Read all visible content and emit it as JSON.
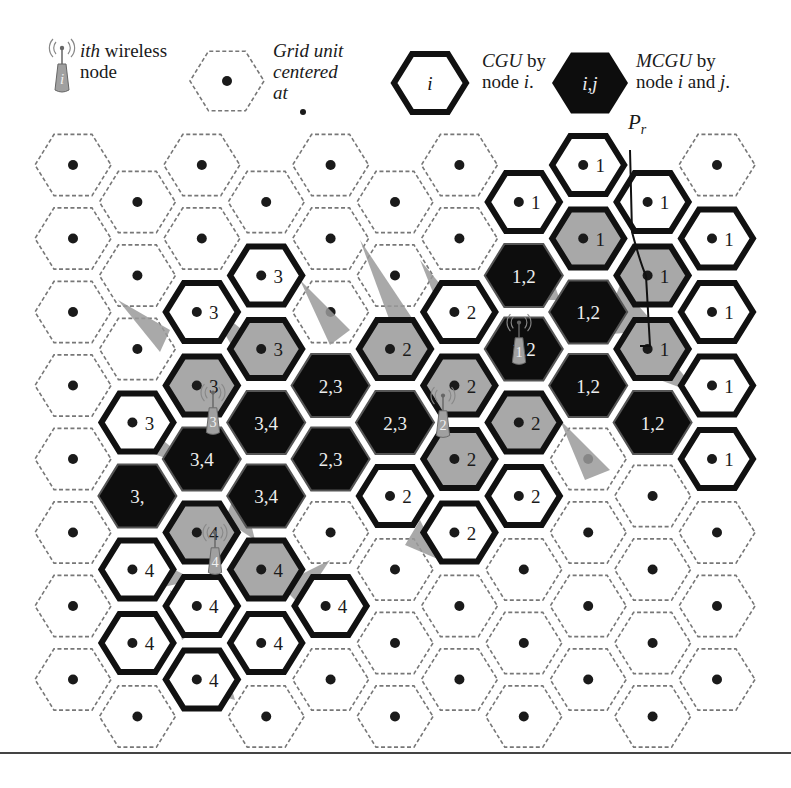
{
  "legend": {
    "node": {
      "italic": "ith",
      "text1": " wireless",
      "text2": "node",
      "glyph": "i"
    },
    "grid_unit": {
      "line1": "Grid unit",
      "line2": "centered",
      "line3": "at"
    },
    "cgu": {
      "glyph": "i",
      "italic": "CGU",
      "text1": " by",
      "text2": "node ",
      "text2_italic": "i",
      "text2_end": "."
    },
    "mcgu": {
      "glyph": "i,j",
      "italic": "MCGU",
      "text1": " by",
      "text2": "node ",
      "i": "i",
      "and": " and ",
      "j": "j",
      "end": "."
    }
  },
  "pr_label": {
    "main": "P",
    "sub": "r"
  },
  "colors": {
    "cgu_border": "#111111",
    "mcgu_fill": "#0d0d0d",
    "shadow_gray": "#9a9a9a",
    "covered_gray": "#a8a8a8",
    "dashed": "#777777",
    "dot": "#1a1a1a",
    "node_body": "#a0a0a0"
  },
  "grid": {
    "columns": 11,
    "rows": 8,
    "x0": 73,
    "col_step": 64.4,
    "y0_even": 165,
    "y0_odd": 202,
    "row_step": 73.5,
    "hex_radius": 40,
    "cells": [
      {
        "c": 1,
        "r": 3,
        "type": "cgu",
        "label": "3",
        "fill": "white"
      },
      {
        "c": 1,
        "r": 4,
        "type": "mcgu",
        "label": "3,"
      },
      {
        "c": 1,
        "r": 5,
        "type": "cgu",
        "label": "4",
        "fill": "white"
      },
      {
        "c": 1,
        "r": 6,
        "type": "cgu",
        "label": "4",
        "fill": "white"
      },
      {
        "c": 2,
        "r": 2,
        "type": "cgu",
        "label": "3",
        "fill": "white"
      },
      {
        "c": 2,
        "r": 3,
        "type": "cgu",
        "label": "3",
        "fill": "gray"
      },
      {
        "c": 2,
        "r": 4,
        "type": "mcgu",
        "label": "3,4"
      },
      {
        "c": 2,
        "r": 5,
        "type": "cgu",
        "label": "4",
        "fill": "gray"
      },
      {
        "c": 2,
        "r": 6,
        "type": "cgu",
        "label": "4",
        "fill": "white"
      },
      {
        "c": 2,
        "r": 7,
        "type": "cgu",
        "label": "4",
        "fill": "white"
      },
      {
        "c": 3,
        "r": 1,
        "type": "cgu",
        "label": "3",
        "fill": "white"
      },
      {
        "c": 3,
        "r": 2,
        "type": "cgu",
        "label": "3",
        "fill": "gray"
      },
      {
        "c": 3,
        "r": 3,
        "type": "mcgu",
        "label": "3,4"
      },
      {
        "c": 3,
        "r": 4,
        "type": "mcgu",
        "label": "3,4"
      },
      {
        "c": 3,
        "r": 5,
        "type": "cgu",
        "label": "4",
        "fill": "gray"
      },
      {
        "c": 3,
        "r": 6,
        "type": "cgu",
        "label": "4",
        "fill": "white"
      },
      {
        "c": 4,
        "r": 3,
        "type": "mcgu",
        "label": "2,3"
      },
      {
        "c": 4,
        "r": 4,
        "type": "mcgu",
        "label": "2,3"
      },
      {
        "c": 4,
        "r": 6,
        "type": "cgu",
        "label": "4",
        "fill": "white"
      },
      {
        "c": 5,
        "r": 2,
        "type": "cgu",
        "label": "2",
        "fill": "gray"
      },
      {
        "c": 5,
        "r": 3,
        "type": "mcgu",
        "label": "2,3"
      },
      {
        "c": 5,
        "r": 4,
        "type": "cgu",
        "label": "2",
        "fill": "white"
      },
      {
        "c": 6,
        "r": 2,
        "type": "cgu",
        "label": "2",
        "fill": "white"
      },
      {
        "c": 6,
        "r": 3,
        "type": "cgu",
        "label": "2",
        "fill": "gray"
      },
      {
        "c": 6,
        "r": 4,
        "type": "cgu",
        "label": "2",
        "fill": "gray"
      },
      {
        "c": 6,
        "r": 5,
        "type": "cgu",
        "label": "2",
        "fill": "white"
      },
      {
        "c": 7,
        "r": 0,
        "type": "cgu",
        "label": "1",
        "fill": "white"
      },
      {
        "c": 7,
        "r": 1,
        "type": "mcgu",
        "label": "1,2"
      },
      {
        "c": 7,
        "r": 2,
        "type": "mcgu",
        "label": "1,2"
      },
      {
        "c": 7,
        "r": 3,
        "type": "cgu",
        "label": "2",
        "fill": "gray"
      },
      {
        "c": 7,
        "r": 4,
        "type": "cgu",
        "label": "2",
        "fill": "white"
      },
      {
        "c": 8,
        "r": 0,
        "type": "cgu",
        "label": "1",
        "fill": "white"
      },
      {
        "c": 8,
        "r": 1,
        "type": "cgu",
        "label": "1",
        "fill": "gray"
      },
      {
        "c": 8,
        "r": 2,
        "type": "mcgu",
        "label": "1,2"
      },
      {
        "c": 8,
        "r": 3,
        "type": "mcgu",
        "label": "1,2"
      },
      {
        "c": 9,
        "r": 0,
        "type": "cgu",
        "label": "1",
        "fill": "white"
      },
      {
        "c": 9,
        "r": 1,
        "type": "cgu",
        "label": "1",
        "fill": "gray"
      },
      {
        "c": 9,
        "r": 2,
        "type": "cgu",
        "label": "1",
        "fill": "gray"
      },
      {
        "c": 9,
        "r": 3,
        "type": "mcgu",
        "label": "1,2"
      },
      {
        "c": 10,
        "r": 1,
        "type": "cgu",
        "label": "1",
        "fill": "white"
      },
      {
        "c": 10,
        "r": 2,
        "type": "cgu",
        "label": "1",
        "fill": "white"
      },
      {
        "c": 10,
        "r": 3,
        "type": "cgu",
        "label": "1",
        "fill": "white"
      },
      {
        "c": 10,
        "r": 4,
        "type": "cgu",
        "label": "1",
        "fill": "white"
      }
    ]
  },
  "nodes": [
    {
      "id": "1",
      "x": 519,
      "y": 352
    },
    {
      "id": "2",
      "x": 443,
      "y": 425
    },
    {
      "id": "3",
      "x": 213,
      "y": 422
    },
    {
      "id": "4",
      "x": 215,
      "y": 562
    }
  ],
  "pr_path": "M630,150 L632,232 Q640,262 646,276 L650,346 L640,346"
}
